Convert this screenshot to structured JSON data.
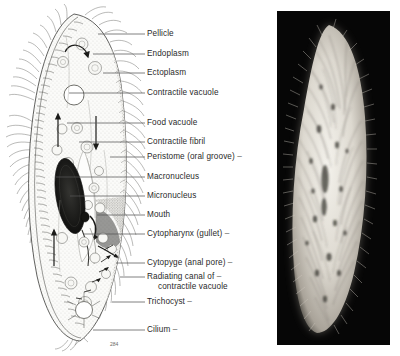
{
  "figure": {
    "background_color": "#ffffff",
    "label_color": "#2a2a2a",
    "leader_line_color": "#555555"
  },
  "drawing": {
    "name": "paramecium-line-drawing",
    "corner_mark": "284",
    "labels": [
      {
        "id": "pellicle",
        "text": "Pellicle",
        "text2": "",
        "y": 34,
        "leader_x1": 98,
        "leader_x2": 145,
        "leader_y": 34,
        "trailing_dash": false
      },
      {
        "id": "endoplasm",
        "text": "Endoplasm",
        "text2": "",
        "y": 54,
        "leader_x1": 93,
        "leader_x2": 145,
        "leader_y": 54,
        "trailing_dash": false
      },
      {
        "id": "ectoplasm",
        "text": "Ectoplasm",
        "text2": "",
        "y": 73,
        "leader_x1": 103,
        "leader_x2": 145,
        "leader_y": 73,
        "trailing_dash": false
      },
      {
        "id": "contractile-vacuole",
        "text": "Contractile vacuole",
        "text2": "",
        "y": 93,
        "leader_x1": 69,
        "leader_x2": 145,
        "leader_y": 93,
        "trailing_dash": false
      },
      {
        "id": "food-vacuole",
        "text": "Food vacuole",
        "text2": "",
        "y": 123,
        "leader_x1": 67,
        "leader_x2": 145,
        "leader_y": 123,
        "trailing_dash": false
      },
      {
        "id": "contractile-fibril",
        "text": "Contractile fibril",
        "text2": "",
        "y": 142,
        "leader_x1": 79,
        "leader_x2": 145,
        "leader_y": 142,
        "trailing_dash": false
      },
      {
        "id": "peristome",
        "text": "Peristome (oral groove)",
        "text2": "",
        "y": 157,
        "leader_x1": 110,
        "leader_x2": 145,
        "leader_y": 157,
        "trailing_dash": true
      },
      {
        "id": "macronucleus",
        "text": "Macronucleus",
        "text2": "",
        "y": 177,
        "leader_x1": 56,
        "leader_x2": 145,
        "leader_y": 177,
        "trailing_dash": false
      },
      {
        "id": "micronucleus",
        "text": "Micronucleus",
        "text2": "",
        "y": 196,
        "leader_x1": 70,
        "leader_x2": 145,
        "leader_y": 196,
        "trailing_dash": false
      },
      {
        "id": "mouth",
        "text": "Mouth",
        "text2": "",
        "y": 215,
        "leader_x1": 97,
        "leader_x2": 145,
        "leader_y": 215,
        "trailing_dash": false
      },
      {
        "id": "cytopharynx",
        "text": "Cytopharynx (gullet)",
        "text2": "",
        "y": 234,
        "leader_x1": 84,
        "leader_x2": 145,
        "leader_y": 234,
        "trailing_dash": true
      },
      {
        "id": "cytopyge",
        "text": "Cytopyge (anal pore)",
        "text2": "",
        "y": 263,
        "leader_x1": 116,
        "leader_x2": 145,
        "leader_y": 263,
        "trailing_dash": true
      },
      {
        "id": "radiating-canal",
        "text": "Radiating canal of",
        "text2": "contractile vacuole",
        "y": 277,
        "leader_x1": 120,
        "leader_x2": 145,
        "leader_y": 277,
        "trailing_dash": true
      },
      {
        "id": "trichocyst",
        "text": "Trichocyst",
        "text2": "",
        "y": 302,
        "leader_x1": 112,
        "leader_x2": 145,
        "leader_y": 302,
        "trailing_dash": true
      },
      {
        "id": "cilium",
        "text": "Cilium",
        "text2": "",
        "y": 330,
        "leader_x1": 93,
        "leader_x2": 145,
        "leader_y": 330,
        "trailing_dash": true
      }
    ]
  },
  "photo": {
    "name": "paramecium-photomicrograph",
    "background_color": "#060606",
    "organism_color": "#e8e6e0",
    "caption": ""
  }
}
